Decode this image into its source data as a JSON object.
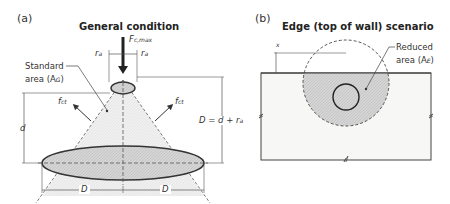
{
  "panel_a": {
    "label": "(a)",
    "title": "General condition",
    "force": {
      "symbol": "F",
      "subscript": "c,max"
    },
    "offset_left": "r",
    "offset_left_sub": "a",
    "offset_right": "r",
    "offset_right_sub": "a",
    "standard_area_line1": "Standard",
    "standard_area_line2": "area (A",
    "standard_area_sub": "G",
    "standard_area_close": ")",
    "tension_left": "f",
    "tension_left_sub": "ct",
    "tension_right": "f",
    "tension_right_sub": "ct",
    "depth": "d",
    "diameter_eq": "D = d + r",
    "diameter_eq_sub": "a",
    "dim_left": "D",
    "dim_right": "D"
  },
  "panel_b": {
    "label": "(b)",
    "title": "Edge (top of wall) scenario",
    "edge_offset": "x",
    "reduced_area_line1": "Reduced",
    "reduced_area_line2": "area (A",
    "reduced_area_sub": "E",
    "reduced_area_close": ")"
  },
  "colors": {
    "line": "#333333",
    "hatch_fill": "#d9d9d9",
    "cone_fill": "#eeeeee",
    "concrete": "#f7f7f5"
  }
}
